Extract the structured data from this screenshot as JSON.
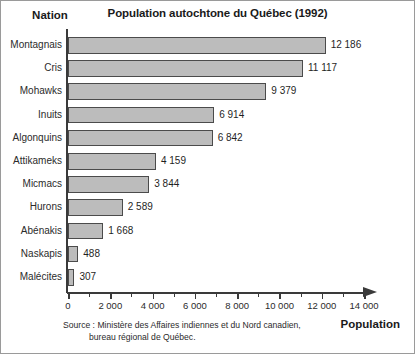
{
  "figure": {
    "title": "Population autochtone du Québec (1992)",
    "y_axis_header": "Nation",
    "x_axis_title": "Population",
    "source_line1": "Source : Ministère des Affaires indiennes et du Nord canadien,",
    "source_line2": "bureau régional de Québec.",
    "bar_fill_color": "#bcbcbc",
    "bar_border_color": "#4b4b4b",
    "axis_color": "#3a3a3a"
  },
  "chart_data": {
    "type": "bar",
    "orientation": "horizontal",
    "title": "Population autochtone du Québec (1992)",
    "xlabel": "Population",
    "ylabel": "Nation",
    "xlim": [
      0,
      14000
    ],
    "grid": false,
    "legend": null,
    "major_tick_step": 2000,
    "minor_tick_step": 1000,
    "tick_labels": [
      "0",
      "2 000",
      "4 000",
      "6 000",
      "8 000",
      "10 000",
      "12 000",
      "14 000"
    ],
    "tick_values": [
      0,
      2000,
      4000,
      6000,
      8000,
      10000,
      12000,
      14000
    ],
    "categories": [
      "Montagnais",
      "Cris",
      "Mohawks",
      "Inuits",
      "Algonquins",
      "Attikameks",
      "Micmacs",
      "Hurons",
      "Abénakis",
      "Naskapis",
      "Malécites"
    ],
    "values": [
      12186,
      11117,
      9379,
      6914,
      6842,
      4159,
      3844,
      2589,
      1668,
      488,
      307
    ],
    "value_labels": [
      "12 186",
      "11 117",
      "9 379",
      "6 914",
      "6 842",
      "4 159",
      "3 844",
      "2 589",
      "1 668",
      "488",
      "307"
    ],
    "annotations": [
      "Source : Ministère des Affaires indiennes et du Nord canadien, bureau régional de Québec."
    ]
  }
}
